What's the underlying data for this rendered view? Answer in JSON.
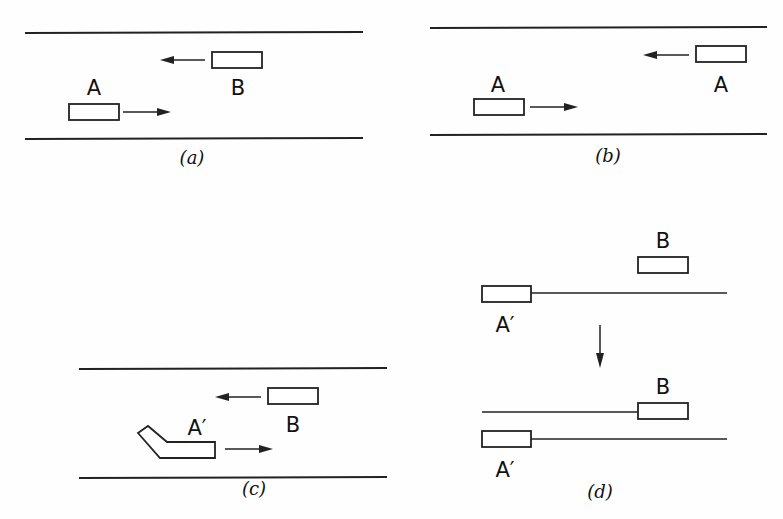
{
  "panels": {
    "a": {
      "caption": "(a)",
      "labels": {
        "car_a": "A",
        "car_b": "B"
      }
    },
    "b": {
      "caption": "(b)",
      "labels": {
        "car_left": "A",
        "car_right": "A"
      }
    },
    "c": {
      "caption": "(c)",
      "labels": {
        "car_a_prime": "A′",
        "car_b": "B"
      }
    },
    "d": {
      "caption": "(d)",
      "labels": {
        "top_b": "B",
        "top_a_prime": "A′",
        "bottom_b": "B",
        "bottom_a_prime": "A′"
      }
    }
  },
  "colors": {
    "ink": "#222222",
    "background": "#fefefe"
  }
}
